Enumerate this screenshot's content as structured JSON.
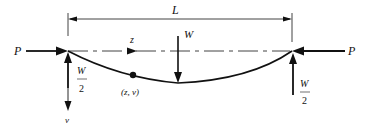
{
  "diagram": {
    "labels": {
      "span": "L",
      "axial_left": "P",
      "axial_right": "P",
      "transverse_load": "W",
      "axis_z": "z",
      "axis_v": "v",
      "point": "(z, v)",
      "reaction_left_num": "W",
      "reaction_left_den": "2",
      "reaction_right_num": "W",
      "reaction_right_den": "2"
    },
    "colors": {
      "line": "#111111",
      "background": "#ffffff"
    }
  }
}
